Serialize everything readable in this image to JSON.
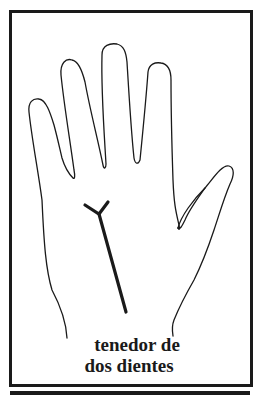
{
  "figure": {
    "caption_line1": "tenedor de",
    "caption_line2": "dos dientes",
    "colors": {
      "ink": "#1a1a1a",
      "background": "#ffffff"
    }
  }
}
